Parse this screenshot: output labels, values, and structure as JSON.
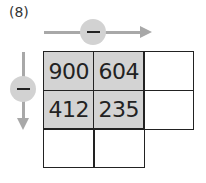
{
  "problem_label": "(8)",
  "operators": {
    "horizontal": {
      "symbol": "minus",
      "direction": "right"
    },
    "vertical": {
      "symbol": "minus",
      "direction": "down"
    }
  },
  "grid": {
    "rows": [
      [
        "900",
        "604",
        ""
      ],
      [
        "412",
        "235",
        ""
      ],
      [
        "",
        ""
      ]
    ]
  },
  "colors": {
    "shaded_cell": "#d3d3d3",
    "arrow": "#a8a8a8",
    "circle": "#d2d2d2"
  }
}
